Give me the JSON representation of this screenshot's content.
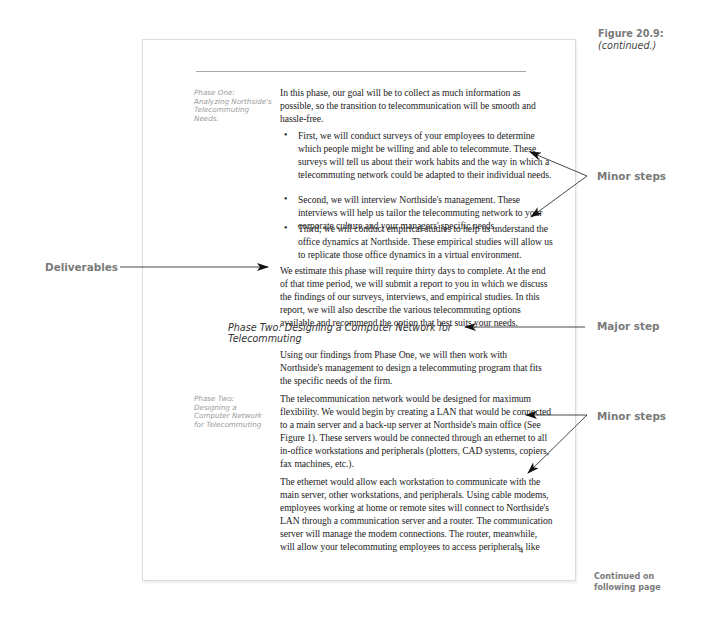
{
  "figure": {
    "number_label": "Figure 20.9:",
    "continued_label": "(continued.)"
  },
  "page": {
    "phase_one_label": [
      "Phase One:",
      "Analyzing Northside's",
      "Telecommuting",
      "Needs."
    ],
    "phase_one_intro": [
      "In this phase, our goal will be to collect as much information as",
      "possible, so the transition to telecommunication will be smooth and",
      "hassle-free."
    ],
    "bullets": [
      {
        "lines": [
          "First, we will conduct surveys of your employees to determine",
          "which people might be willing and able to telecommute. These",
          "surveys will tell us about their work habits and the way in which a",
          "telecommuting network could be adapted to their individual needs."
        ]
      },
      {
        "lines": [
          "Second, we will interview Northside's management. These",
          "interviews will help us tailor the telecommuting network to your",
          "corporate culture and your managers' specific needs."
        ]
      },
      {
        "lines": [
          "Third, we will conduct empirical studies to help us understand the",
          "office dynamics at Northside. These empirical studies will allow us",
          "to replicate those office dynamics in a virtual environment."
        ]
      }
    ],
    "deliverables_para": [
      "We estimate this phase will require thirty days to complete. At the end",
      "of that time period, we will submit a report to you in which we discuss",
      "the findings of our surveys, interviews, and empirical studies. In this",
      "report, we will also describe the various telecommuting options",
      "available and recommend the option that best suits your needs."
    ],
    "major_heading": [
      "Phase Two: Designing a Computer Network for",
      "Telecommuting"
    ],
    "phase_two_intro": [
      "Using our findings from Phase One, we will then work with",
      "Northside's management to design a telecommuting program that fits",
      "the specific needs of the firm."
    ],
    "phase_two_label": [
      "Phase Two:",
      "Designing a",
      "Computer Network",
      "for Telecommuting"
    ],
    "network_para": [
      "The telecommunication network would be designed for maximum",
      "flexibility. We would begin by creating a LAN that would be connected",
      "to a main server and a back-up server at Northside's main office (See",
      "Figure 1). These servers would be connected through an ethernet to all",
      "in-office workstations and peripherals (plotters, CAD systems, copiers,",
      "fax machines, etc.)."
    ],
    "ethernet_para": [
      "The ethernet would allow each workstation to communicate with the",
      "main server, other workstations, and peripherals. Using cable modems,",
      "employees working at home or remote sites will connect to Northside's",
      "LAN through a communication server and a router. The communication",
      "server will manage the modem connections. The router, meanwhile,",
      "will allow your telecommuting employees to access peripherals, like"
    ],
    "page_number": "4",
    "bullet_glyph": "•"
  },
  "annotations": {
    "minor_steps_1": "Minor steps",
    "deliverables": "Deliverables",
    "major_step": "Major step",
    "minor_steps_2": "Minor steps",
    "continued": [
      "Continued on",
      "following page"
    ]
  },
  "colors": {
    "annotation_gray": "#7a7a7a",
    "side_label_gray": "#9a9a9a",
    "body_text": "#222222",
    "page_border": "#dcdcdc"
  }
}
